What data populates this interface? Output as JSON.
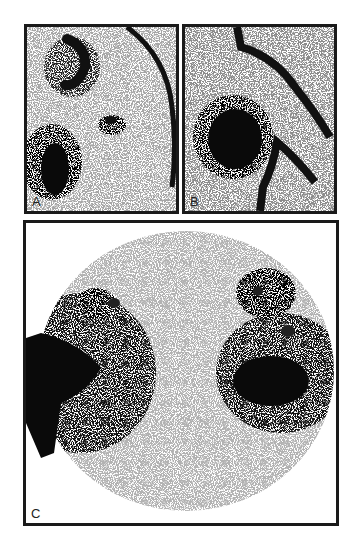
{
  "figure": {
    "panels": [
      {
        "id": "A",
        "label": "A",
        "description": "Scintigraphic image with curved uptake structures and a dense focal spot at lower left"
      },
      {
        "id": "B",
        "label": "B",
        "description": "Scintigraphic image with dense round uptake at left center and curved linear structures"
      },
      {
        "id": "C",
        "label": "C",
        "description": "Circular field-of-view scintigram with two bilateral dense uptake regions"
      }
    ]
  }
}
